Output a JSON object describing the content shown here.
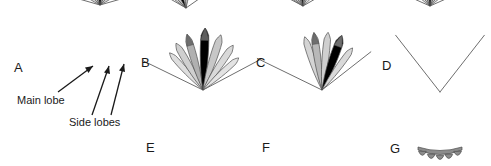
{
  "figure": {
    "name": "antenna-radiation-pattern-lobes",
    "background_color": "#ffffff",
    "width": 491,
    "height": 166,
    "colors": {
      "main_lobe": "#000000",
      "side_lobe_dark": "#8c8c8c",
      "side_lobe_mid": "#b5b5b5",
      "side_lobe_light": "#d4d4d4",
      "side_lobe_pale": "#e6e6e6",
      "outline": "#6e6e6e",
      "stroke": "#4d4d4d",
      "text": "#1a1a1a"
    }
  },
  "annotations": {
    "main_lobe_label": "Main lobe",
    "side_lobes_label": "Side lobes"
  },
  "panels": [
    {
      "letter": "A",
      "letter_x": 14,
      "letter_y": 72,
      "apex_x": 100,
      "apex_y": 5,
      "description": "symmetric broad pattern with black main lobe, annotated with Main lobe and Side lobes arrows",
      "annotated": true,
      "lobes": [
        {
          "name": "outline-left-far",
          "angle": -74,
          "length": 62,
          "width": 1.0,
          "fill": "none",
          "type": "line"
        },
        {
          "name": "outline-right-far",
          "angle": 74,
          "length": 62,
          "width": 1.0,
          "fill": "none",
          "type": "line"
        },
        {
          "name": "side-lobe-left-3",
          "angle": -50,
          "length": 52,
          "width": 9.0,
          "fill": "#d4d4d4",
          "type": "lobe"
        },
        {
          "name": "side-lobe-right-3",
          "angle": 50,
          "length": 52,
          "width": 9.0,
          "fill": "#d4d4d4",
          "type": "lobe"
        },
        {
          "name": "side-lobe-left-2",
          "angle": -34,
          "length": 56,
          "width": 10.0,
          "fill": "#c6c6c6",
          "type": "lobe"
        },
        {
          "name": "side-lobe-right-2",
          "angle": 34,
          "length": 56,
          "width": 10.0,
          "fill": "#c6c6c6",
          "type": "lobe"
        },
        {
          "name": "side-lobe-left-1",
          "angle": -17,
          "length": 58,
          "width": 10.0,
          "fill": "#b5b5b5",
          "type": "lobe"
        },
        {
          "name": "side-lobe-right-1",
          "angle": 17,
          "length": 58,
          "width": 10.0,
          "fill": "#b5b5b5",
          "type": "lobe"
        },
        {
          "name": "main-lobe",
          "angle": 0,
          "length": 62,
          "width": 11.0,
          "fill": "#000000",
          "type": "lobe"
        }
      ]
    },
    {
      "letter": "B",
      "letter_x": 141,
      "letter_y": 67,
      "apex_x": 186,
      "apex_y": 8,
      "description": "asymmetric pattern, black main lobe tilted left of boresight",
      "annotated": false,
      "lobes": [
        {
          "name": "outline-left-far",
          "angle": -60,
          "length": 66,
          "width": 1.0,
          "fill": "none",
          "type": "line"
        },
        {
          "name": "outline-right-far",
          "angle": 55,
          "length": 70,
          "width": 1.0,
          "fill": "none",
          "type": "line"
        },
        {
          "name": "side-lobe-left-3",
          "angle": -46,
          "length": 48,
          "width": 6.5,
          "fill": "#d4d4d4",
          "type": "lobe"
        },
        {
          "name": "side-lobe-left-2",
          "angle": -36,
          "length": 52,
          "width": 7.5,
          "fill": "#c2c2c2",
          "type": "lobe"
        },
        {
          "name": "main-lobe",
          "angle": -20,
          "length": 56,
          "width": 9.5,
          "fill": "#000000",
          "type": "lobe"
        },
        {
          "name": "side-lobe-right-1",
          "angle": -6,
          "length": 56,
          "width": 8.0,
          "fill": "#d9d9d9",
          "type": "lobe"
        },
        {
          "name": "side-lobe-right-2",
          "angle": 4,
          "length": 58,
          "width": 8.0,
          "fill": "#b5b5b5",
          "type": "lobe",
          "tip": "#6e6e6e"
        }
      ]
    },
    {
      "letter": "C",
      "letter_x": 256,
      "letter_y": 67,
      "apex_x": 303,
      "apex_y": 6,
      "description": "narrow black main lobe near boresight with grey side lobes fanned left",
      "annotated": false,
      "lobes": [
        {
          "name": "outline-left-far",
          "angle": -62,
          "length": 68,
          "width": 1.0,
          "fill": "none",
          "type": "line"
        },
        {
          "name": "outline-right-far",
          "angle": 60,
          "length": 68,
          "width": 1.0,
          "fill": "none",
          "type": "line"
        },
        {
          "name": "side-lobe-left-4",
          "angle": -50,
          "length": 50,
          "width": 6.0,
          "fill": "#dedede",
          "type": "lobe"
        },
        {
          "name": "side-lobe-left-3",
          "angle": -42,
          "length": 54,
          "width": 7.0,
          "fill": "#cfcfcf",
          "type": "lobe"
        },
        {
          "name": "side-lobe-left-2",
          "angle": -30,
          "length": 56,
          "width": 8.0,
          "fill": "#c2c2c2",
          "type": "lobe"
        },
        {
          "name": "side-lobe-left-1",
          "angle": -16,
          "length": 58,
          "width": 8.5,
          "fill": "#b5b5b5",
          "type": "lobe"
        },
        {
          "name": "main-lobe",
          "angle": -3,
          "length": 62,
          "width": 9.0,
          "fill": "#000000",
          "type": "lobe"
        },
        {
          "name": "side-lobe-right-1",
          "angle": 10,
          "length": 58,
          "width": 8.0,
          "fill": "#9e9e9e",
          "type": "lobe",
          "tip": "#6e6e6e"
        },
        {
          "name": "side-lobe-right-2",
          "angle": 24,
          "length": 54,
          "width": 8.0,
          "fill": "#cfcfcf",
          "type": "lobe"
        },
        {
          "name": "side-lobe-right-3",
          "angle": 38,
          "length": 50,
          "width": 7.0,
          "fill": "#dedede",
          "type": "lobe"
        }
      ]
    },
    {
      "letter": "D",
      "letter_x": 382,
      "letter_y": 70,
      "apex_x": 430,
      "apex_y": 6,
      "description": "symmetric narrow black main lobe on boresight with pale grey side lobes",
      "annotated": false,
      "lobes": [
        {
          "name": "outline-left-far",
          "angle": -66,
          "length": 68,
          "width": 1.0,
          "fill": "none",
          "type": "line"
        },
        {
          "name": "outline-right-far",
          "angle": 66,
          "length": 68,
          "width": 1.0,
          "fill": "none",
          "type": "line"
        },
        {
          "name": "side-lobe-left-3",
          "angle": -44,
          "length": 52,
          "width": 6.5,
          "fill": "#dedede",
          "type": "lobe"
        },
        {
          "name": "side-lobe-right-3",
          "angle": 44,
          "length": 52,
          "width": 6.5,
          "fill": "#dedede",
          "type": "lobe"
        },
        {
          "name": "side-lobe-left-2",
          "angle": -30,
          "length": 56,
          "width": 7.5,
          "fill": "#cfcfcf",
          "type": "lobe"
        },
        {
          "name": "side-lobe-right-2",
          "angle": 30,
          "length": 56,
          "width": 7.5,
          "fill": "#cfcfcf",
          "type": "lobe"
        },
        {
          "name": "side-lobe-left-1",
          "angle": -15,
          "length": 60,
          "width": 8.0,
          "fill": "#bdbdbd",
          "type": "lobe"
        },
        {
          "name": "side-lobe-right-1",
          "angle": 15,
          "length": 60,
          "width": 8.0,
          "fill": "#bdbdbd",
          "type": "lobe"
        },
        {
          "name": "main-lobe",
          "angle": 0,
          "length": 66,
          "width": 8.5,
          "fill": "#000000",
          "type": "lobe",
          "tip": "#5e5e5e"
        }
      ]
    },
    {
      "letter": "E",
      "letter_x": 146,
      "letter_y": 152,
      "apex_x": 203,
      "apex_y": 90,
      "description": "black main lobe right of centre with grey side lobes both sides",
      "annotated": false,
      "lobes": [
        {
          "name": "outline-left-far",
          "angle": -64,
          "length": 66,
          "width": 1.0,
          "fill": "none",
          "type": "line"
        },
        {
          "name": "outline-right-far",
          "angle": 62,
          "length": 66,
          "width": 1.0,
          "fill": "none",
          "type": "line"
        },
        {
          "name": "side-lobe-left-3",
          "angle": -42,
          "length": 50,
          "width": 6.5,
          "fill": "#dedede",
          "type": "lobe"
        },
        {
          "name": "side-lobe-left-2",
          "angle": -30,
          "length": 54,
          "width": 7.5,
          "fill": "#cfcfcf",
          "type": "lobe"
        },
        {
          "name": "side-lobe-left-1",
          "angle": -16,
          "length": 58,
          "width": 8.0,
          "fill": "#b0b0b0",
          "type": "lobe",
          "tip": "#6e6e6e"
        },
        {
          "name": "main-lobe",
          "angle": 2,
          "length": 62,
          "width": 9.5,
          "fill": "#000000",
          "type": "lobe",
          "tip": "#5e5e5e"
        },
        {
          "name": "side-lobe-right-1",
          "angle": 18,
          "length": 58,
          "width": 8.5,
          "fill": "#c7c7c7",
          "type": "lobe"
        },
        {
          "name": "side-lobe-right-2",
          "angle": 34,
          "length": 54,
          "width": 7.5,
          "fill": "#d9d9d9",
          "type": "lobe"
        },
        {
          "name": "side-lobe-right-3",
          "angle": 48,
          "length": 48,
          "width": 6.5,
          "fill": "#e3e3e3",
          "type": "lobe"
        }
      ]
    },
    {
      "letter": "F",
      "letter_x": 262,
      "letter_y": 152,
      "apex_x": 322,
      "apex_y": 90,
      "description": "asymmetric pattern, black main lobe tilted right of boresight",
      "annotated": false,
      "lobes": [
        {
          "name": "outline-left-far",
          "angle": -64,
          "length": 72,
          "width": 1.0,
          "fill": "none",
          "type": "line"
        },
        {
          "name": "outline-right-far",
          "angle": 52,
          "length": 62,
          "width": 1.0,
          "fill": "none",
          "type": "line"
        },
        {
          "name": "side-lobe-left-2",
          "angle": -18,
          "length": 56,
          "width": 7.5,
          "fill": "#d4d4d4",
          "type": "lobe"
        },
        {
          "name": "side-lobe-left-1",
          "angle": -8,
          "length": 58,
          "width": 8.0,
          "fill": "#b8b8b8",
          "type": "lobe",
          "tip": "#6e6e6e"
        },
        {
          "name": "side-lobe-mid",
          "angle": 6,
          "length": 58,
          "width": 8.0,
          "fill": "#cfcfcf",
          "type": "lobe"
        },
        {
          "name": "main-lobe",
          "angle": 20,
          "length": 58,
          "width": 9.5,
          "fill": "#000000",
          "type": "lobe",
          "tip": "#6e6e6e"
        },
        {
          "name": "side-lobe-right-1",
          "angle": 36,
          "length": 52,
          "width": 7.0,
          "fill": "#d9d9d9",
          "type": "lobe"
        }
      ]
    },
    {
      "letter": "G",
      "letter_x": 390,
      "letter_y": 153,
      "apex_x": 440,
      "apex_y": 92,
      "description": "no main lobe, only thin V outline with a row of five small scalloped grey bumps at the base",
      "annotated": false,
      "bump_count": 5,
      "lobes": [
        {
          "name": "outline-left-far",
          "angle": -38,
          "length": 72,
          "width": 1.0,
          "fill": "none",
          "type": "line"
        },
        {
          "name": "outline-right-far",
          "angle": 38,
          "length": 72,
          "width": 1.0,
          "fill": "none",
          "type": "line"
        }
      ]
    }
  ]
}
